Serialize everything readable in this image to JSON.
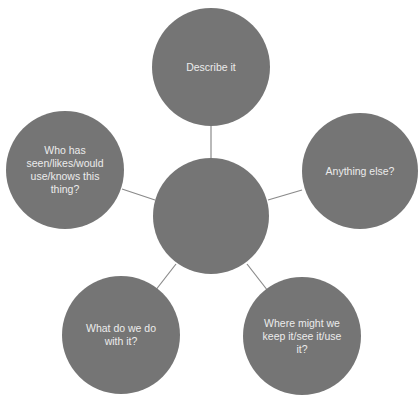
{
  "diagram": {
    "type": "mind-map",
    "colors": {
      "node_fill": "#757575",
      "node_text": "#ececec",
      "connector": "#8a8a8a",
      "background": "#ffffff"
    },
    "center": {
      "label": "",
      "cx": 211,
      "cy": 216,
      "r": 58
    },
    "nodes": [
      {
        "id": "top",
        "label": "Describe it",
        "cx": 211,
        "cy": 67,
        "r": 59
      },
      {
        "id": "left",
        "label": "Who has\nseen/likes/would\nuse/knows this\nthing?",
        "cx": 65,
        "cy": 170,
        "r": 59
      },
      {
        "id": "right",
        "label": "Anything else?",
        "cx": 360,
        "cy": 171,
        "r": 58
      },
      {
        "id": "bottom-left",
        "label": "What do we do\nwith it?",
        "cx": 121,
        "cy": 335,
        "r": 59
      },
      {
        "id": "bottom-right",
        "label": "Where might we\nkeep it/see it/use\nit?",
        "cx": 302,
        "cy": 336,
        "r": 59
      }
    ],
    "connectors": [
      {
        "to": "top",
        "x1": 211,
        "y1": 158,
        "x2": 211,
        "y2": 126
      },
      {
        "to": "left",
        "x1": 155,
        "y1": 200,
        "x2": 122,
        "y2": 189
      },
      {
        "to": "right",
        "x1": 268,
        "y1": 200,
        "x2": 302,
        "y2": 190
      },
      {
        "to": "bottom-left",
        "x1": 176,
        "y1": 264,
        "x2": 155,
        "y2": 291
      },
      {
        "to": "bottom-right",
        "x1": 247,
        "y1": 264,
        "x2": 268,
        "y2": 291
      }
    ]
  }
}
